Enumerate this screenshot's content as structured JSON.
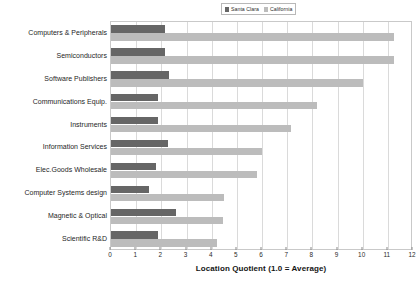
{
  "chart_data": {
    "type": "bar",
    "orientation": "horizontal",
    "title": "",
    "xlabel": "Location Quotient (1.0 = Average)",
    "ylabel": "",
    "xlim": [
      0,
      12
    ],
    "xticks": [
      0,
      1,
      2,
      3,
      4,
      5,
      6,
      7,
      8,
      9,
      10,
      11,
      12
    ],
    "grid": true,
    "legend_position": "top",
    "categories": [
      "Computers & Peripherals",
      "Semiconductors",
      "Software Publishers",
      "Communications Equip.",
      "Instruments",
      "Information Services",
      "Elec.Goods Wholesale",
      "Computer Systems design",
      "Magnetic & Optical",
      "Scientific R&D"
    ],
    "series": [
      {
        "name": "Santa Clara",
        "color": "#666666",
        "values": [
          2.15,
          2.15,
          2.3,
          1.85,
          1.85,
          2.25,
          1.8,
          1.5,
          2.6,
          1.85
        ]
      },
      {
        "name": "California",
        "color": "#bcbcbc",
        "values": [
          11.25,
          11.25,
          10.0,
          8.2,
          7.15,
          6.0,
          5.8,
          4.5,
          4.45,
          4.2
        ]
      }
    ]
  },
  "legend": {
    "entries": [
      {
        "label": "Santa Clara",
        "color": "#666666"
      },
      {
        "label": "California",
        "color": "#bcbcbc"
      }
    ]
  }
}
